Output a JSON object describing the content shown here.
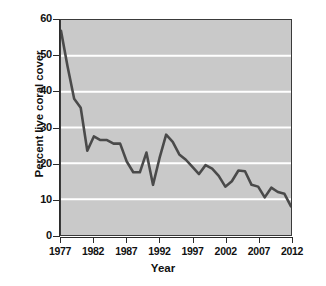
{
  "chart_data": {
    "type": "line",
    "title": "",
    "xlabel": "Year",
    "ylabel": "Percent live coral cover",
    "xlim": [
      1977,
      2012
    ],
    "ylim": [
      0,
      60
    ],
    "grid": true,
    "legend": false,
    "x_ticks": [
      1977,
      1982,
      1987,
      1992,
      1997,
      2002,
      2007,
      2012
    ],
    "y_ticks": [
      0,
      10,
      20,
      30,
      40,
      50,
      60
    ],
    "gridlines_at": [
      10,
      20,
      30,
      40,
      50
    ],
    "line_color": "#4a4a4a",
    "plot_background": "#c9c9c9",
    "gridline_color": "#ffffff",
    "axis_color": "#2b2b2b",
    "x": [
      1977,
      1978,
      1979,
      1980,
      1981,
      1982,
      1983,
      1984,
      1985,
      1986,
      1987,
      1988,
      1989,
      1990,
      1991,
      1992,
      1993,
      1994,
      1995,
      1996,
      1997,
      1998,
      1999,
      2000,
      2001,
      2002,
      2003,
      2004,
      2005,
      2006,
      2007,
      2008,
      2009,
      2010,
      2011,
      2012
    ],
    "values": [
      57,
      47,
      38,
      35.5,
      23.5,
      27.5,
      26.5,
      26.5,
      25.5,
      25.5,
      20.5,
      17.5,
      17.5,
      23,
      14,
      21.5,
      28,
      26,
      22.5,
      21,
      19,
      17,
      19.5,
      18.5,
      16.5,
      13.5,
      15,
      18,
      17.8,
      14,
      13.5,
      10.5,
      13.2,
      12,
      11.5,
      8
    ]
  },
  "axis": {
    "y_label": "Percent live coral cover",
    "x_label": "Year"
  }
}
